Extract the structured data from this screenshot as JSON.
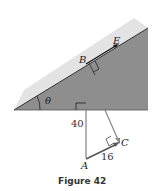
{
  "figure": {
    "caption": "Figure 42",
    "labels": {
      "B": "B",
      "E": "E",
      "theta": "θ",
      "A": "A",
      "C": "C"
    },
    "values": {
      "vertical_length": "40",
      "AC_length": "16"
    },
    "colors": {
      "incline_dark": "#8e8e8e",
      "incline_light": "#e3e3e3",
      "vector": "#8a8a8a",
      "arrow": "#555555"
    }
  }
}
